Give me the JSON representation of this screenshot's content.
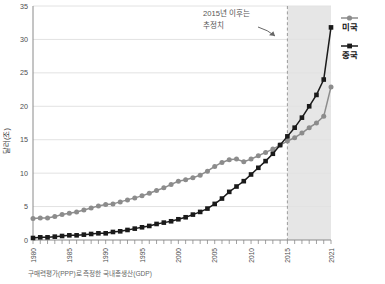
{
  "chart_data": {
    "type": "line",
    "title": "",
    "subtitle": "",
    "xlabel": "",
    "ylabel": "달러(조)",
    "xlim": [
      1980,
      2021
    ],
    "ylim": [
      0,
      35
    ],
    "ytick_step": 5,
    "yticks": [
      "0",
      "5",
      "10",
      "15",
      "20",
      "25",
      "30",
      "35"
    ],
    "xticks": [
      "1980",
      "1985",
      "1990",
      "1995",
      "2000",
      "2005",
      "2010",
      "2015",
      "2021"
    ],
    "grid": "horizontal",
    "legend_position": "right",
    "x": [
      1980,
      1981,
      1982,
      1983,
      1984,
      1985,
      1986,
      1987,
      1988,
      1989,
      1990,
      1991,
      1992,
      1993,
      1994,
      1995,
      1996,
      1997,
      1998,
      1999,
      2000,
      2001,
      2002,
      2003,
      2004,
      2005,
      2006,
      2007,
      2008,
      2009,
      2010,
      2011,
      2012,
      2013,
      2014,
      2015,
      2016,
      2017,
      2018,
      2019,
      2020,
      2021
    ],
    "series": [
      {
        "name": "미국",
        "marker": "circle",
        "color": "#8c8c8c",
        "values": [
          3.2,
          3.3,
          3.3,
          3.5,
          3.8,
          4.0,
          4.2,
          4.5,
          4.8,
          5.1,
          5.3,
          5.4,
          5.7,
          6.0,
          6.3,
          6.6,
          7.0,
          7.4,
          7.8,
          8.3,
          8.8,
          9.0,
          9.3,
          9.7,
          10.3,
          11.0,
          11.6,
          12.0,
          12.1,
          11.7,
          12.1,
          12.6,
          13.1,
          13.6,
          14.2,
          14.8,
          15.3,
          16.0,
          16.8,
          17.5,
          18.5,
          22.9
        ]
      },
      {
        "name": "중국",
        "marker": "square",
        "color": "#1a1a1a",
        "values": [
          0.3,
          0.4,
          0.4,
          0.5,
          0.6,
          0.7,
          0.7,
          0.8,
          0.9,
          1.0,
          1.0,
          1.2,
          1.3,
          1.5,
          1.7,
          1.9,
          2.1,
          2.4,
          2.6,
          2.8,
          3.1,
          3.4,
          3.8,
          4.2,
          4.7,
          5.4,
          6.2,
          7.2,
          8.0,
          8.8,
          9.8,
          10.8,
          11.8,
          12.9,
          14.2,
          15.5,
          16.8,
          18.3,
          20.0,
          21.7,
          24.0,
          31.8
        ]
      }
    ],
    "forecast_boundary_year": 2015,
    "annotations": [
      {
        "name": "forecast-note",
        "text_line1": "2015년 이후는",
        "text_line2": "추정치"
      }
    ],
    "caption": "구매력평가(PPP)로 측정한 국내총생산(GDP)"
  },
  "legend": {
    "items": [
      {
        "label": "미국"
      },
      {
        "label": "중국"
      }
    ]
  },
  "colors": {
    "usa": "#8c8c8c",
    "china": "#1a1a1a",
    "grid": "#e2e2e2",
    "forecast_band": "#e6e6e6",
    "axis": "#8a8a8a"
  }
}
